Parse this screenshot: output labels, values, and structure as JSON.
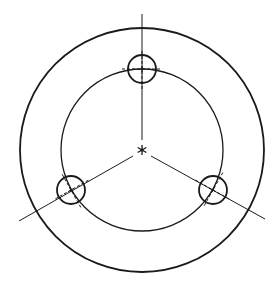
{
  "diagram": {
    "type": "engineering-drawing",
    "colors": {
      "background": "#ffffff",
      "stroke": "#1a1a1a"
    },
    "center": {
      "x": 142,
      "y": 150
    },
    "outer_circle": {
      "cx": 142,
      "cy": 150,
      "r": 122
    },
    "pitch_circle": {
      "cx": 142,
      "cy": 150,
      "r": 81
    },
    "holes": [
      {
        "id": "top",
        "cx": 142,
        "cy": 69,
        "r": 14
      },
      {
        "id": "lower-left",
        "cx": 71,
        "cy": 190,
        "r": 14
      },
      {
        "id": "lower-right",
        "cx": 213,
        "cy": 190,
        "r": 14
      }
    ],
    "center_lines": [
      {
        "id": "vertical",
        "x1": 142,
        "y1": 14,
        "x2": 142,
        "y2": 140
      },
      {
        "id": "lower-left",
        "x1": 133,
        "y1": 156,
        "x2": 19,
        "y2": 221
      },
      {
        "id": "lower-right",
        "x1": 151,
        "y1": 156,
        "x2": 265,
        "y2": 219
      }
    ],
    "center_mark": {
      "symbol": "asterisk",
      "size": 5
    }
  }
}
